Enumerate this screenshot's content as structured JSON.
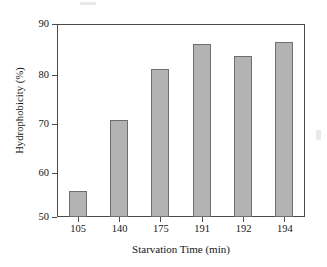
{
  "chart_data": {
    "type": "bar",
    "title": "",
    "xlabel": "Starvation Time (min)",
    "ylabel": "Hydrophobicity (%)",
    "categories": [
      "105",
      "140",
      "175",
      "191",
      "192",
      "194"
    ],
    "values": [
      55.3,
      70.2,
      80.6,
      85.8,
      83.3,
      86.2
    ],
    "ylim": [
      50,
      90
    ],
    "yticks": [
      "50",
      "60",
      "70",
      "80",
      "90"
    ],
    "ytick_values": [
      50,
      60,
      70,
      80,
      90
    ],
    "grid": false,
    "legend": "none",
    "bar_color": "#b3b3b3",
    "bar_edge_color": "#6e6e6e",
    "axis_color": "#4a4a4a",
    "background_color": "#ffffff"
  }
}
